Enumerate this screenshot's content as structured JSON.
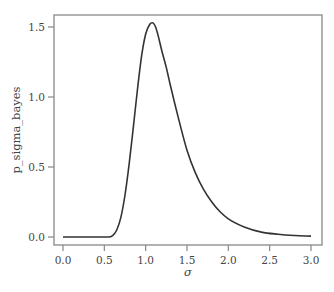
{
  "chart_data": {
    "type": "line",
    "title": "",
    "xlabel": "σ",
    "ylabel": "p_sigma_bayes",
    "xlim": [
      -0.07,
      3.13
    ],
    "ylim": [
      -0.057,
      1.6
    ],
    "xticks": [
      0.0,
      0.5,
      1.0,
      1.5,
      2.0,
      2.5,
      3.0
    ],
    "xtick_labels": [
      "0.0",
      "0.5",
      "1.0",
      "1.5",
      "2.0",
      "2.5",
      "3.0"
    ],
    "yticks": [
      0.0,
      0.5,
      1.0,
      1.5
    ],
    "ytick_labels": [
      "0.0",
      "0.5",
      "1.0",
      "1.5"
    ],
    "grid": false,
    "legend": null,
    "series": [
      {
        "name": "p_sigma_bayes",
        "color": "#333333",
        "x": [
          0.0,
          0.55,
          0.6,
          0.65,
          0.7,
          0.75,
          0.8,
          0.85,
          0.9,
          0.95,
          1.0,
          1.05,
          1.08,
          1.12,
          1.2,
          1.25,
          1.3,
          1.4,
          1.5,
          1.6,
          1.7,
          1.8,
          1.9,
          2.0,
          2.2,
          2.4,
          2.6,
          2.8,
          3.0
        ],
        "y": [
          0.0,
          0.0,
          0.01,
          0.05,
          0.14,
          0.3,
          0.52,
          0.78,
          1.05,
          1.29,
          1.45,
          1.52,
          1.53,
          1.5,
          1.32,
          1.21,
          1.08,
          0.84,
          0.62,
          0.46,
          0.34,
          0.25,
          0.18,
          0.13,
          0.07,
          0.035,
          0.02,
          0.011,
          0.006
        ]
      }
    ],
    "annotations": []
  },
  "layout": {
    "frame": {
      "left": 54,
      "top": 15,
      "right": 322,
      "bottom": 245
    },
    "x_px": {
      "v0": 0.0,
      "p0": 63,
      "v1": 3.0,
      "p1": 311
    },
    "y_px": {
      "v0": 0.0,
      "p0": 237,
      "v1": 1.5,
      "p1": 27
    },
    "colors": {
      "frame": "#888888",
      "line": "#333333",
      "text": "#444444"
    }
  }
}
